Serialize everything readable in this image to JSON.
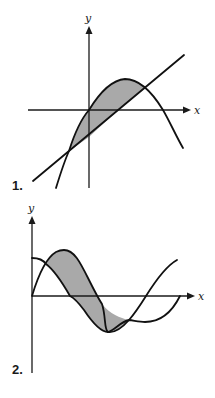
{
  "colors": {
    "shade": "#a9a9a9",
    "ink": "#111111"
  },
  "figures": [
    {
      "number_label": "1.",
      "x_axis_label": "x",
      "y_axis_label": "y",
      "description": "Region between a downward-opening parabola and a line, bounded by their two intersection points, shaded gray"
    },
    {
      "number_label": "2.",
      "x_axis_label": "x",
      "y_axis_label": "y",
      "description": "Region between two sinusoidal curves (sine-like starting at origin and cosine-like starting above origin) between consecutive intersections, shaded gray"
    }
  ]
}
